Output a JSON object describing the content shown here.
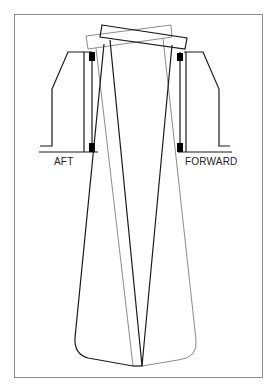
{
  "diagram": {
    "labels": {
      "aft": "AFT",
      "forward": "FORWARD"
    },
    "colors": {
      "frame": "#8a8a8a",
      "dark_line": "#1a1a1a",
      "light_line": "#8c8c8c",
      "seal_block": "#000000",
      "background": "#ffffff"
    },
    "elements": [
      "outer-frame",
      "aft-housing",
      "forward-housing",
      "aft-seal-blocks",
      "forward-seal-blocks",
      "tilted-blade-dark",
      "tilted-blade-light"
    ]
  }
}
